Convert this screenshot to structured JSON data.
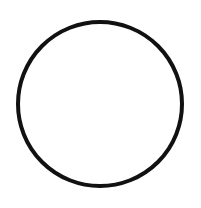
{
  "canvas": {
    "width": 201,
    "height": 208,
    "background": "#ffffff"
  },
  "shape": {
    "type": "circle",
    "cx": 100,
    "cy": 104,
    "r": 82,
    "stroke": "#111111",
    "stroke_width": 4,
    "fill": "none"
  }
}
